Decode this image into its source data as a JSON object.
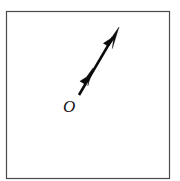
{
  "figure": {
    "canvas": {
      "width": 180,
      "height": 181,
      "background": "#ffffff"
    },
    "frame": {
      "name": "figure-border",
      "x": 6.5,
      "y": 11.5,
      "width": 163,
      "height": 167,
      "stroke_color": "#4a4a4a",
      "stroke_width": 1.2,
      "fill": "#ffffff"
    },
    "vector": {
      "label": "O",
      "color": "#0b0b0b",
      "shaft_width": 2.6,
      "tail": {
        "x": 79,
        "y": 95
      },
      "tip": {
        "x": 119,
        "y": 27
      },
      "tip_head": {
        "points": "119,27 110.5,46.5 116.2,43.6 110.0,52.0 108.6,44.0 112.0,44.8",
        "length": 22,
        "half_width": 5.2
      },
      "mid_head": {
        "anchor": {
          "x": 93,
          "y": 68
        },
        "points": "95.5,62.0 88.0,79.5 92.6,75.6 88.3,82.2 86.2,75.0 89.8,76.0",
        "length": 18,
        "half_width": 4.6
      }
    },
    "origin_label": {
      "text": "O",
      "x": 63,
      "y": 112,
      "font_size": 17,
      "italic": true,
      "color": "#141414"
    }
  }
}
